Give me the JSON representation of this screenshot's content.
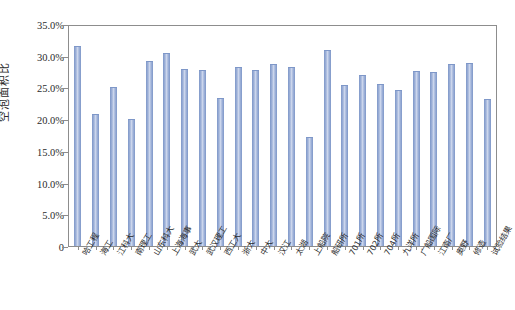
{
  "chart_data": {
    "type": "bar",
    "title": "",
    "xlabel": "",
    "ylabel": "空泡面积比",
    "ylim": [
      0,
      35
    ],
    "grid": false,
    "legend": null,
    "y_tick_labels": [
      "35.0%",
      "30.0%",
      "25.0%",
      "20.0%",
      "15.0%",
      "10.0%",
      "5.0%",
      "0"
    ],
    "y_tick_values": [
      35,
      30,
      25,
      20,
      15,
      10,
      5,
      0
    ],
    "unit": "%",
    "categories": [
      "哈工程",
      "海工",
      "江科大",
      "南理工",
      "山东科大",
      "上海海事",
      "武大",
      "武汉理工",
      "西工大",
      "浙大",
      "中大",
      "汉江",
      "太湖",
      "上船院",
      "船研所",
      "701所",
      "702所",
      "704所",
      "九洋所",
      "广船国际",
      "江南厂",
      "奥野",
      "修造",
      "试验结果"
    ],
    "values": [
      31.7,
      20.8,
      25.2,
      20.1,
      29.2,
      30.6,
      28.0,
      27.9,
      23.4,
      28.3,
      27.9,
      28.8,
      28.3,
      17.2,
      31.0,
      25.4,
      27.1,
      25.6,
      24.7,
      27.7,
      27.6,
      28.8,
      28.9,
      23.3
    ],
    "series": [
      {
        "name": "空泡面积比",
        "color": "#9fb2d9",
        "values": [
          31.7,
          20.8,
          25.2,
          20.1,
          29.2,
          30.6,
          28.0,
          27.9,
          23.4,
          28.3,
          27.9,
          28.8,
          28.3,
          17.2,
          31.0,
          25.4,
          27.1,
          25.6,
          24.7,
          27.7,
          27.6,
          28.8,
          28.9,
          23.3
        ]
      }
    ],
    "colors": {
      "bar_fill": "#9fb2d9",
      "bar_edge": "#7e97c8",
      "axis": "#8d8d8d",
      "text": "#2b2b2b",
      "background": "#ffffff"
    }
  }
}
